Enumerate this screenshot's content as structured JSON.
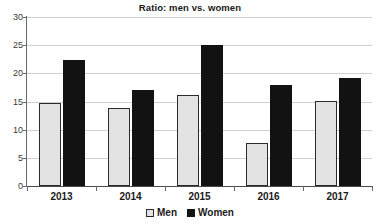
{
  "chart_data": {
    "type": "bar",
    "title": "Ratio: men vs. women",
    "xlabel": "",
    "ylabel": "",
    "categories": [
      "2013",
      "2014",
      "2015",
      "2016",
      "2017"
    ],
    "series": [
      {
        "name": "Men",
        "color": "#e3e3e3",
        "values": [
          14.8,
          13.8,
          16.1,
          7.7,
          15.1
        ]
      },
      {
        "name": "Women",
        "color": "#121212",
        "values": [
          22.3,
          17.0,
          25.0,
          17.9,
          19.1
        ]
      }
    ],
    "ylim": [
      0,
      30
    ],
    "ytick_values": [
      0,
      5,
      10,
      15,
      20,
      25,
      30
    ],
    "ytick_labels": [
      "0",
      "5",
      "10",
      "15",
      "20",
      "25",
      "30"
    ],
    "grid": "horizontal",
    "legend_position": "bottom-center"
  },
  "legend": {
    "items": [
      {
        "label": "Men",
        "swatch": "men-swatch"
      },
      {
        "label": "Women",
        "swatch": "women-swatch"
      }
    ]
  }
}
